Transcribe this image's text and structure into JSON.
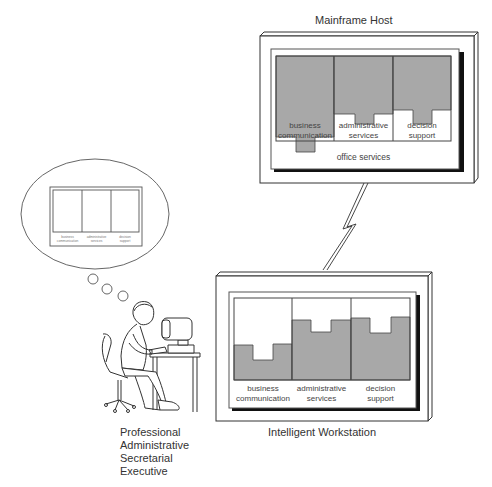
{
  "mainframe": {
    "title": "Mainframe Host",
    "columns": [
      {
        "label_line1": "business",
        "label_line2": "communication"
      },
      {
        "label_line1": "administrative",
        "label_line2": "services"
      },
      {
        "label_line1": "decision",
        "label_line2": "support"
      }
    ],
    "footer": "office services"
  },
  "workstation": {
    "title": "Intelligent Workstation",
    "columns": [
      {
        "label_line1": "business",
        "label_line2": "communication"
      },
      {
        "label_line1": "administrative",
        "label_line2": "services"
      },
      {
        "label_line1": "decision",
        "label_line2": "support"
      }
    ]
  },
  "thought_bubble": {
    "columns": [
      {
        "label_line1": "business",
        "label_line2": "communication"
      },
      {
        "label_line1": "administrative",
        "label_line2": "services"
      },
      {
        "label_line1": "decision",
        "label_line2": "support"
      }
    ]
  },
  "user_roles": [
    "Professional",
    "Administrative",
    "Secretarial",
    "Executive"
  ],
  "colors": {
    "shade": "#a8a8a8",
    "line": "#333333",
    "shadow": "#111111"
  }
}
